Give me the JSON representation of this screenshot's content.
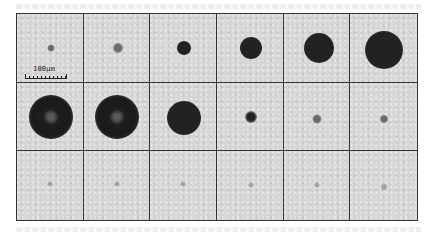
{
  "figure": {
    "rows": 3,
    "columns": 6,
    "scale_bar": {
      "label": "100µm"
    },
    "frames": [
      [
        {
          "dot_diameter_px": 7,
          "cx": 34,
          "cy": 34,
          "intensity": "medium",
          "ring": false
        },
        {
          "dot_diameter_px": 10,
          "cx": 34,
          "cy": 34,
          "intensity": "medium",
          "ring": false
        },
        {
          "dot_diameter_px": 14,
          "cx": 34,
          "cy": 34,
          "intensity": "dark",
          "ring": false
        },
        {
          "dot_diameter_px": 22,
          "cx": 34,
          "cy": 34,
          "intensity": "dark",
          "ring": false
        },
        {
          "dot_diameter_px": 30,
          "cx": 35,
          "cy": 34,
          "intensity": "dark",
          "ring": false
        },
        {
          "dot_diameter_px": 38,
          "cx": 34,
          "cy": 36,
          "intensity": "dark",
          "ring": false
        }
      ],
      [
        {
          "dot_diameter_px": 44,
          "cx": 34,
          "cy": 34,
          "intensity": "dark",
          "ring": true
        },
        {
          "dot_diameter_px": 44,
          "cx": 33,
          "cy": 34,
          "intensity": "dark",
          "ring": true
        },
        {
          "dot_diameter_px": 34,
          "cx": 34,
          "cy": 35,
          "intensity": "dark",
          "ring": false
        },
        {
          "dot_diameter_px": 12,
          "cx": 34,
          "cy": 34,
          "intensity": "dark",
          "ring": false
        },
        {
          "dot_diameter_px": 9,
          "cx": 33,
          "cy": 36,
          "intensity": "medium",
          "ring": false
        },
        {
          "dot_diameter_px": 8,
          "cx": 34,
          "cy": 36,
          "intensity": "medium",
          "ring": false
        }
      ],
      [
        {
          "dot_diameter_px": 5,
          "cx": 33,
          "cy": 33,
          "intensity": "faint",
          "ring": false
        },
        {
          "dot_diameter_px": 5,
          "cx": 33,
          "cy": 33,
          "intensity": "faint",
          "ring": false
        },
        {
          "dot_diameter_px": 5,
          "cx": 33,
          "cy": 33,
          "intensity": "faint",
          "ring": false
        },
        {
          "dot_diameter_px": 5,
          "cx": 34,
          "cy": 34,
          "intensity": "faint",
          "ring": false
        },
        {
          "dot_diameter_px": 5,
          "cx": 33,
          "cy": 34,
          "intensity": "faint",
          "ring": false
        },
        {
          "dot_diameter_px": 6,
          "cx": 34,
          "cy": 36,
          "intensity": "faint",
          "ring": false
        }
      ]
    ]
  }
}
